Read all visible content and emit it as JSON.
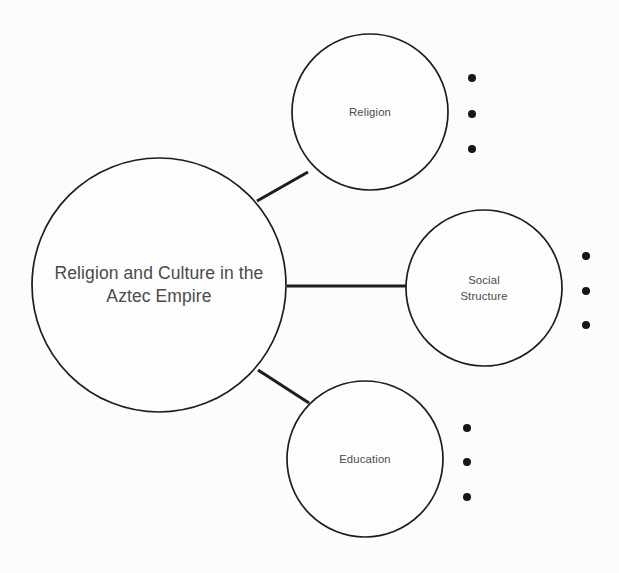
{
  "diagram": {
    "type": "concept-map",
    "background_color": "#fcfcfc",
    "stroke_color": "#1d1d1d",
    "text_color": "#4b4b4b",
    "bullet_color": "#161616",
    "central_node": {
      "label": "Religion and Culture in the\nAztec Empire",
      "cx": 159,
      "cy": 285,
      "r": 127
    },
    "branches": [
      {
        "id": "religion",
        "label": "Religion",
        "cx": 370,
        "cy": 112,
        "r": 78,
        "bullets": [
          {
            "cx": 472,
            "cy": 78,
            "r": 4
          },
          {
            "cx": 472,
            "cy": 114,
            "r": 4
          },
          {
            "cx": 472,
            "cy": 149,
            "r": 4
          }
        ],
        "connector": {
          "x1": 257,
          "y1": 201,
          "x2": 308,
          "y2": 172
        }
      },
      {
        "id": "social-structure",
        "label": "Social\nStructure",
        "cx": 484,
        "cy": 288,
        "r": 78,
        "bullets": [
          {
            "cx": 586,
            "cy": 256,
            "r": 4
          },
          {
            "cx": 586,
            "cy": 291,
            "r": 4
          },
          {
            "cx": 586,
            "cy": 325,
            "r": 4
          }
        ],
        "connector": {
          "x1": 287,
          "y1": 286,
          "x2": 407,
          "y2": 286
        }
      },
      {
        "id": "education",
        "label": "Education",
        "cx": 365,
        "cy": 459,
        "r": 78,
        "bullets": [
          {
            "cx": 467,
            "cy": 428,
            "r": 4
          },
          {
            "cx": 467,
            "cy": 462,
            "r": 4
          },
          {
            "cx": 467,
            "cy": 497,
            "r": 4
          }
        ],
        "connector": {
          "x1": 258,
          "y1": 370,
          "x2": 309,
          "y2": 403
        }
      }
    ]
  }
}
